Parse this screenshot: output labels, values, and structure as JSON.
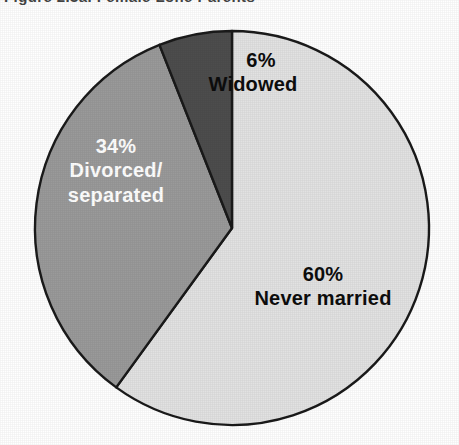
{
  "figure": {
    "title": "Figure 2.3a.  Female Lone Parents"
  },
  "chart_data": {
    "type": "pie",
    "title": "Figure 2.3a.  Female Lone Parents",
    "categories": [
      "Never married",
      "Divorced/separated",
      "Widowed"
    ],
    "values": [
      60,
      34,
      6
    ],
    "value_labels": [
      "60%",
      "34%",
      "6%"
    ],
    "unit": "percent",
    "start_angle_deg": 0,
    "direction": "clockwise",
    "legend": "none",
    "labels_inside_slices": true,
    "colors": [
      "#e2e2e2",
      "#9a9a9a",
      "#4d4d4d"
    ],
    "label_text_colors": [
      "#0d0d0d",
      "#ffffff",
      "#0d0d0d"
    ],
    "slices": [
      {
        "name": "Never married",
        "value": 60,
        "value_label": "60%",
        "color": "#e2e2e2",
        "label_color": "#0d0d0d",
        "start_deg": 0,
        "end_deg": 216
      },
      {
        "name": "Divorced/separated",
        "value": 34,
        "value_label": "34%",
        "color": "#9a9a9a",
        "label_color": "#ffffff",
        "label_line_1": "Divorced/",
        "label_line_2": "separated",
        "start_deg": 216,
        "end_deg": 338.4
      },
      {
        "name": "Widowed",
        "value": 6,
        "value_label": "6%",
        "color": "#4d4d4d",
        "label_color": "#0d0d0d",
        "start_deg": 338.4,
        "end_deg": 360
      }
    ]
  },
  "geometry": {
    "center_x": 232,
    "center_y": 228,
    "radius": 197,
    "outline_color": "#1a1a1a"
  }
}
